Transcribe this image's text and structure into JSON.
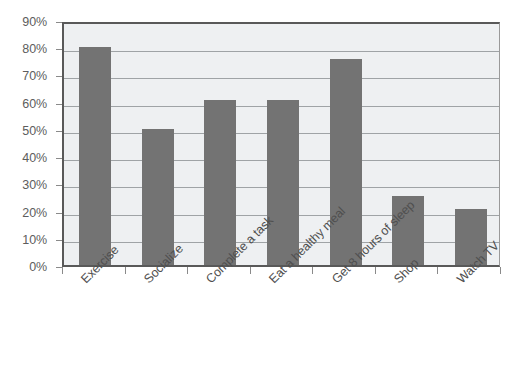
{
  "chart_data": {
    "type": "bar",
    "title": "",
    "subtitle": "",
    "xlabel": "",
    "ylabel": "",
    "categories": [
      "Exercise",
      "Socialize",
      "Complete a task",
      "Eat a healthy meal",
      "Get 8 hours of sleep",
      "Shop",
      "Watch TV"
    ],
    "values": [
      80,
      50,
      60.5,
      60.5,
      75.5,
      25.5,
      20.5
    ],
    "value_unit": "%",
    "ylim": [
      0,
      90
    ],
    "y_tick_labels": [
      "0%",
      "10%",
      "20%",
      "30%",
      "40%",
      "50%",
      "60%",
      "70%",
      "80%",
      "90%"
    ],
    "y_tick_values": [
      0,
      10,
      20,
      30,
      40,
      50,
      60,
      70,
      80,
      90
    ],
    "grid": true,
    "legend": false,
    "legend_position": "none",
    "bar_color": "#737373",
    "plot_background": "#eef0f2",
    "gridline_color": "#9fa3a6",
    "axis_color": "#595959",
    "label_rotation": -45
  }
}
